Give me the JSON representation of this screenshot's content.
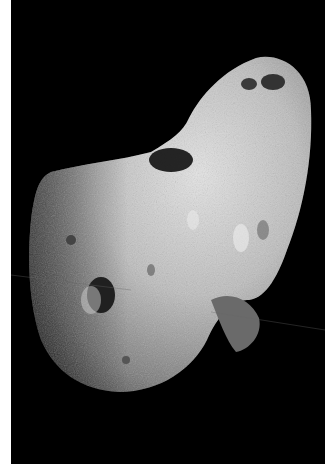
{
  "image": {
    "subject": "asteroid",
    "description": "Grayscale photograph of an elongated, cratered asteroid against a black space background",
    "colors": {
      "background": "#000000",
      "border": "#ffffff",
      "surface_light": "#d8d8d8",
      "surface_mid": "#9a9a9a",
      "surface_dark": "#4a4a4a"
    }
  }
}
